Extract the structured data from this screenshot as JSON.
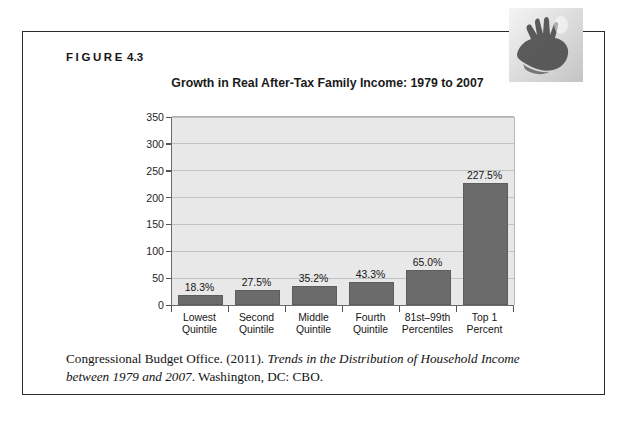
{
  "figure": {
    "label_word": "FIGURE",
    "label_number": "4.3"
  },
  "chart_data": {
    "type": "bar",
    "title": "Growth in Real After-Tax Family Income: 1979 to 2007",
    "xlabel": "",
    "ylabel": "",
    "ylim": [
      0,
      350
    ],
    "yticks": [
      0,
      50,
      100,
      150,
      200,
      250,
      300,
      350
    ],
    "ytick_labels": [
      "0",
      "50",
      "100",
      "150",
      "200",
      "250",
      "300",
      "350"
    ],
    "grid": true,
    "legend": null,
    "categories": [
      "Lowest Quintile",
      "Second Quintile",
      "Middle Quintile",
      "Fourth Quintile",
      "81st–99th Percentiles",
      "Top 1 Percent"
    ],
    "category_lines": [
      [
        "Lowest",
        "Quintile"
      ],
      [
        "Second",
        "Quintile"
      ],
      [
        "Middle",
        "Quintile"
      ],
      [
        "Fourth",
        "Quintile"
      ],
      [
        "81st–99th",
        "Percentiles"
      ],
      [
        "Top 1",
        "Percent"
      ]
    ],
    "values": [
      18.3,
      27.5,
      35.2,
      43.3,
      65.0,
      227.5
    ],
    "data_labels": [
      "18.3%",
      "27.5%",
      "35.2%",
      "43.3%",
      "65.0%",
      "227.5%"
    ],
    "bar_color": "#6b6b6b",
    "plot_background": "#e8e8e8"
  },
  "citation": {
    "part1": "Congressional Budget Office. (2011). ",
    "italic1": "Trends in the Distribution of Household Income between 1979 and 2007",
    "part2": ". Washington, DC: CBO."
  },
  "decoration": {
    "icon": "hand-silhouette-graphic"
  }
}
